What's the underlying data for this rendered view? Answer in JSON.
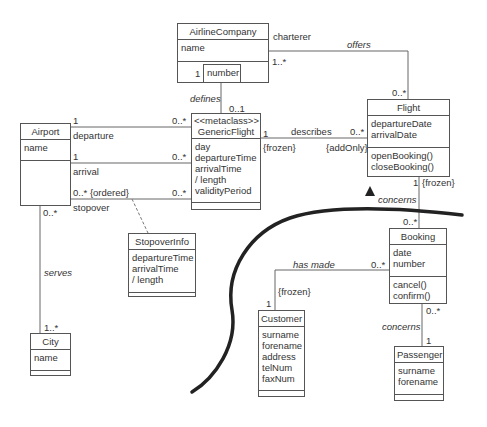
{
  "classes": {
    "airline_company": {
      "name": "AirlineCompany",
      "attributes": [
        "name"
      ],
      "operations": []
    },
    "airport": {
      "name": "Airport",
      "attributes": [
        "name"
      ],
      "operations": []
    },
    "generic_flight": {
      "stereotype": "<<metaclass>>",
      "name": "GenericFlight",
      "attributes": [
        "day",
        "departureTime",
        "arrivalTime",
        "/ length",
        "validityPeriod"
      ],
      "operations": []
    },
    "flight": {
      "name": "Flight",
      "attributes": [
        "departureDate",
        "arrivalDate"
      ],
      "operations": [
        "openBooking()",
        "closeBooking()"
      ]
    },
    "stopover_info": {
      "name": "StopoverInfo",
      "attributes": [
        "departureTime",
        "arrivalTime",
        "/ length"
      ],
      "operations": []
    },
    "city": {
      "name": "City",
      "attributes": [
        "name"
      ],
      "operations": []
    },
    "booking": {
      "name": "Booking",
      "attributes": [
        "date",
        "number"
      ],
      "operations": [
        "cancel()",
        "confirm()"
      ]
    },
    "customer": {
      "name": "Customer",
      "attributes": [
        "surname",
        "forename",
        "address",
        "telNum",
        "faxNum"
      ],
      "operations": []
    },
    "passenger": {
      "name": "Passenger",
      "attributes": [
        "surname",
        "forename"
      ],
      "operations": []
    }
  },
  "qualifier": {
    "label": "number"
  },
  "associations": {
    "offers": {
      "name": "offers",
      "role": "charterer",
      "mult_company": "1..*",
      "mult_flight": "0..*"
    },
    "defines": {
      "name": "defines",
      "mult_company": "1",
      "mult_generic": "0..1"
    },
    "departure": {
      "role": "departure",
      "mult_airport": "1",
      "mult_generic": "0..*"
    },
    "arrival": {
      "role": "arrival",
      "mult_airport": "1",
      "mult_generic": "0..*"
    },
    "stopover": {
      "role": "stopover",
      "mult_airport": "0..* {ordered}",
      "mult_generic": "0..*"
    },
    "describes": {
      "name": "describes",
      "mult_generic": "1",
      "constraint_generic": "{frozen}",
      "mult_flight": "0..*",
      "constraint_flight": "{addOnly}"
    },
    "serves": {
      "name": "serves",
      "mult_airport": "0..*",
      "mult_city": "1..*"
    },
    "concerns_flight": {
      "name": "concerns",
      "mult_flight": "1",
      "constraint": "{frozen}",
      "mult_booking": "0..*"
    },
    "has_made": {
      "name": "has made",
      "mult_booking": "0..*",
      "mult_customer": "1",
      "constraint": "{frozen}"
    },
    "concerns_passenger": {
      "name": "concerns",
      "mult_booking": "0..*",
      "mult_passenger": "1"
    }
  },
  "colors": {
    "line": "#555555",
    "text": "#333333",
    "curve": "#222222"
  }
}
